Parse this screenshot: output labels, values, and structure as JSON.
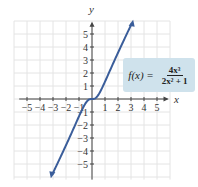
{
  "chart_data": {
    "type": "line",
    "title": "",
    "function": "f(x) = 4x^3 / (2x^2 + 1)",
    "xlabel": "x",
    "ylabel": "y",
    "xlim": [
      -6,
      6
    ],
    "ylim": [
      -6,
      6
    ],
    "grid": true,
    "x_ticks": [
      -5,
      -4,
      -3,
      -2,
      -1,
      1,
      2,
      3,
      4,
      5
    ],
    "y_ticks": [
      -5,
      -4,
      -3,
      -2,
      -1,
      1,
      2,
      3,
      4,
      5
    ],
    "series": [
      {
        "name": "f(x)",
        "color": "#3a5d9a",
        "x": [
          -3,
          -2,
          -1,
          -0.5,
          0,
          0.5,
          1,
          2,
          3
        ],
        "values": [
          -5.68,
          -3.56,
          -1.33,
          -0.33,
          0,
          0.33,
          1.33,
          3.56,
          5.68
        ]
      }
    ],
    "annotation": {
      "label": "f(x) =",
      "numerator": "4x³",
      "denominator": "2x² + 1",
      "background": "#cfe2ec"
    }
  },
  "labels": {
    "x_axis": "x",
    "y_axis": "y",
    "formula_lhs": "f(x) =",
    "formula_num": "4x³",
    "formula_den": "2x² + 1"
  }
}
